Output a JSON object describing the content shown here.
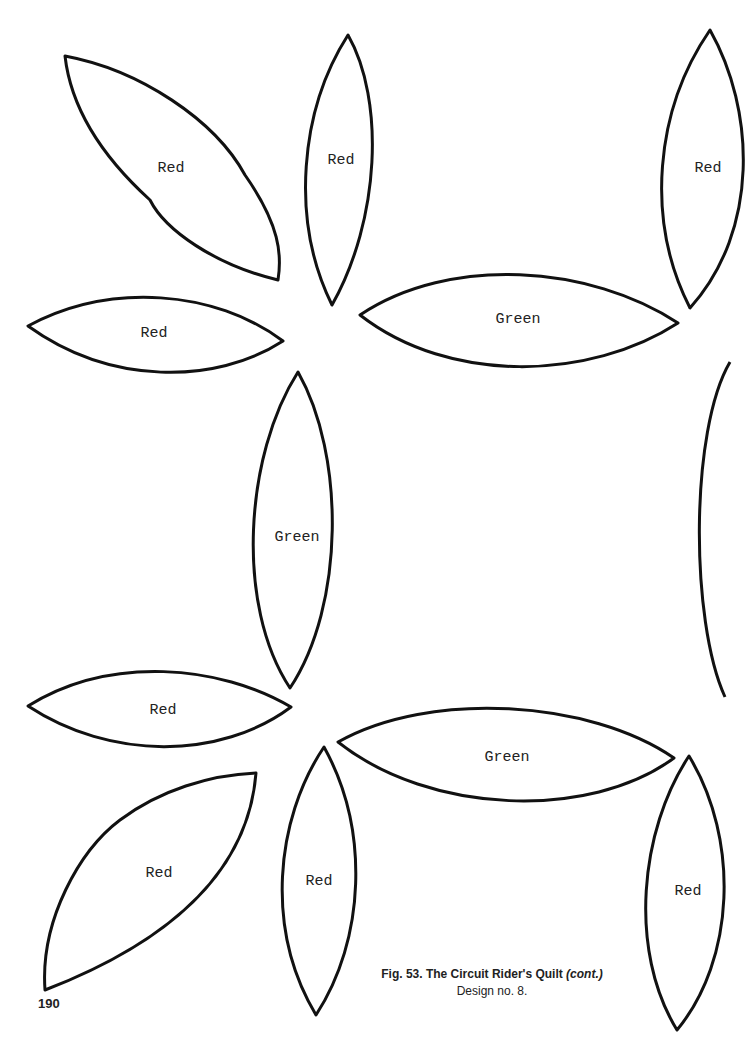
{
  "page": {
    "number": "190",
    "caption": {
      "figure": "Fig. 53. The Circuit Rider's Quilt",
      "continued": "(cont.)",
      "subtitle": "Design no. 8."
    }
  },
  "pattern_pieces": [
    {
      "id": "p1",
      "color_label": "Red",
      "orientation": "diagonal"
    },
    {
      "id": "p2",
      "color_label": "Red",
      "orientation": "vertical"
    },
    {
      "id": "p3",
      "color_label": "Red",
      "orientation": "vertical"
    },
    {
      "id": "p4",
      "color_label": "Red",
      "orientation": "horizontal"
    },
    {
      "id": "p5",
      "color_label": "Green",
      "orientation": "horizontal"
    },
    {
      "id": "p6",
      "color_label": "Green",
      "orientation": "vertical"
    },
    {
      "id": "p7",
      "color_label": "Red",
      "orientation": "horizontal"
    },
    {
      "id": "p8",
      "color_label": "Green",
      "orientation": "horizontal"
    },
    {
      "id": "p9",
      "color_label": "Red",
      "orientation": "diagonal"
    },
    {
      "id": "p10",
      "color_label": "Red",
      "orientation": "vertical"
    },
    {
      "id": "p11",
      "color_label": "Red",
      "orientation": "vertical"
    }
  ]
}
